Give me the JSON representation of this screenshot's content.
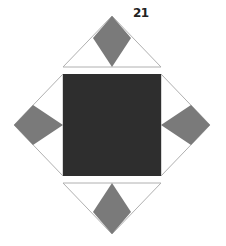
{
  "figure": {
    "label": "21",
    "colors": {
      "background": "#ffffff",
      "center_square": "#2e2e2e",
      "diamond": "#7a7a7a",
      "triangle_outline": "#b0b0b0"
    }
  }
}
